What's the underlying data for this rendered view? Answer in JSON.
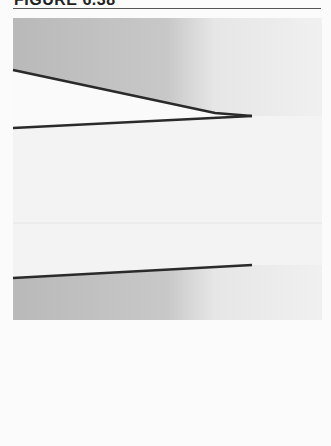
{
  "header": {
    "title": "FIGURE 6.38"
  },
  "figure": {
    "colors": {
      "background": "#f4f4f4",
      "shade_dark": "#bcbcbc",
      "shade_light": "#efefef",
      "line": "#2a2a2a"
    },
    "lines": [
      {
        "name": "upper-sloping-line",
        "x1": 13,
        "y1": 70,
        "x2": 215,
        "y2": 113,
        "x3": 252,
        "y3": 116
      },
      {
        "name": "middle-line",
        "x1": 13,
        "y1": 128,
        "x2": 252,
        "y2": 116
      },
      {
        "name": "lower-line",
        "x1": 13,
        "y1": 278,
        "x2": 252,
        "y2": 265
      }
    ],
    "regions": [
      {
        "name": "upper-shaded-region",
        "top": 18,
        "bottom_follows": "upper-sloping-line"
      },
      {
        "name": "lower-shaded-region",
        "top_follows": "lower-line",
        "bottom": 320
      }
    ]
  }
}
